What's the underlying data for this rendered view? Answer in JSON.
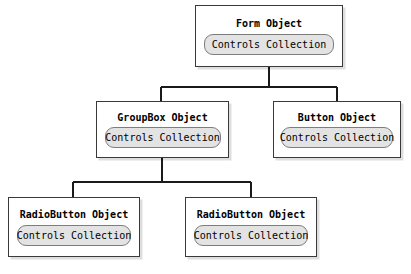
{
  "diagram": {
    "colors": {
      "background": "#ffffff",
      "box_border": "#3a3a3a",
      "box_fill": "#ffffff",
      "capsule_fill": "#e3e3e3",
      "capsule_border": "#7d7d7d",
      "connector": "#1a1a1a",
      "text": "#000000"
    },
    "capsule_label": "Controls Collection",
    "nodes": [
      {
        "id": "form",
        "title": "Form Object",
        "capsule": "Controls Collection",
        "level": 0
      },
      {
        "id": "groupbox",
        "title": "GroupBox Object",
        "capsule": "Controls Collection",
        "level": 1
      },
      {
        "id": "button",
        "title": "Button Object",
        "capsule": "Controls Collection",
        "level": 1
      },
      {
        "id": "radio1",
        "title": "RadioButton Object",
        "capsule": "Controls Collection",
        "level": 2
      },
      {
        "id": "radio2",
        "title": "RadioButton Object",
        "capsule": "Controls Collection",
        "level": 2
      }
    ],
    "edges": [
      {
        "from": "form",
        "to": "groupbox"
      },
      {
        "from": "form",
        "to": "button"
      },
      {
        "from": "groupbox",
        "to": "radio1"
      },
      {
        "from": "groupbox",
        "to": "radio2"
      }
    ]
  }
}
